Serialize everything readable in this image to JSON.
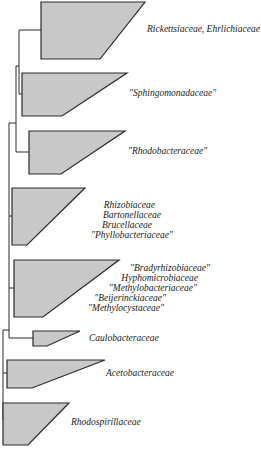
{
  "diagram": {
    "type": "phylogenetic-tree",
    "colors": {
      "wedge_fill": "#c8c8c8",
      "line": "#2a2a2a",
      "background": "#ffffff"
    },
    "clades": [
      {
        "id": "rickettsiaceae",
        "lines": [
          "Rickettsiaceae, Ehrlichiaceae"
        ]
      },
      {
        "id": "sphingomonadaceae",
        "lines": [
          "\"Sphingomonadaceae\""
        ]
      },
      {
        "id": "rhodobacteraceae",
        "lines": [
          "\"Rhodobacteraceae\""
        ]
      },
      {
        "id": "rhizobiaceae",
        "lines": [
          "Rhizobiaceae",
          "Bartonellaceae",
          "Brucellaceae",
          "\"Phyllobacteriaceae\""
        ]
      },
      {
        "id": "bradyrhizobiaceae",
        "lines": [
          "\"Bradyrhizobiaceae\"",
          "Hyphomicrobiaceae",
          "\"Methylobacteriaceae\"",
          "\"Beijerinckiaceae\"",
          "\"Methylocystaceae\""
        ]
      },
      {
        "id": "caulobacteraceae",
        "lines": [
          "Caulobacteraceae"
        ]
      },
      {
        "id": "acetobacteraceae",
        "lines": [
          "Acetobacteraceae"
        ]
      },
      {
        "id": "rhodospirillaceae",
        "lines": [
          "Rhodospirillaceae"
        ]
      }
    ]
  }
}
